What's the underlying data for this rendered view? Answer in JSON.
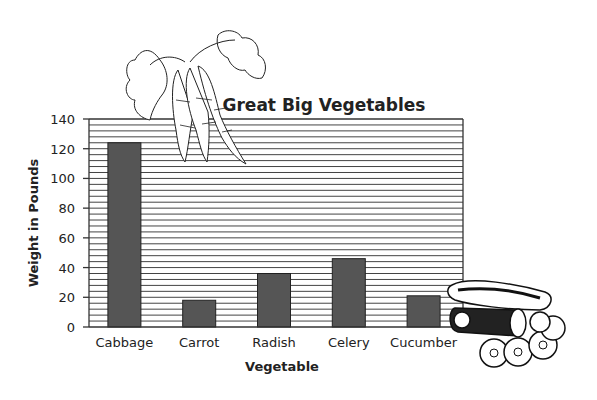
{
  "chart_data": {
    "type": "bar",
    "title": "Great Big Vegetables",
    "xlabel": "Vegetable",
    "ylabel": "Weight in Pounds",
    "categories": [
      "Cabbage",
      "Carrot",
      "Radish",
      "Celery",
      "Cucumber"
    ],
    "values": [
      124,
      18,
      36,
      46,
      21
    ],
    "ylim": [
      0,
      140
    ],
    "yticks": [
      0,
      20,
      40,
      60,
      80,
      100,
      120,
      140
    ],
    "minor_grid_step": 4,
    "grid": true,
    "legend": "none",
    "decorations": [
      "carrot-illustration",
      "cucumber-illustration"
    ]
  },
  "colors": {
    "bar": "#555555",
    "bar_outline": "#222222",
    "grid": "#444444",
    "axis": "#333333"
  }
}
